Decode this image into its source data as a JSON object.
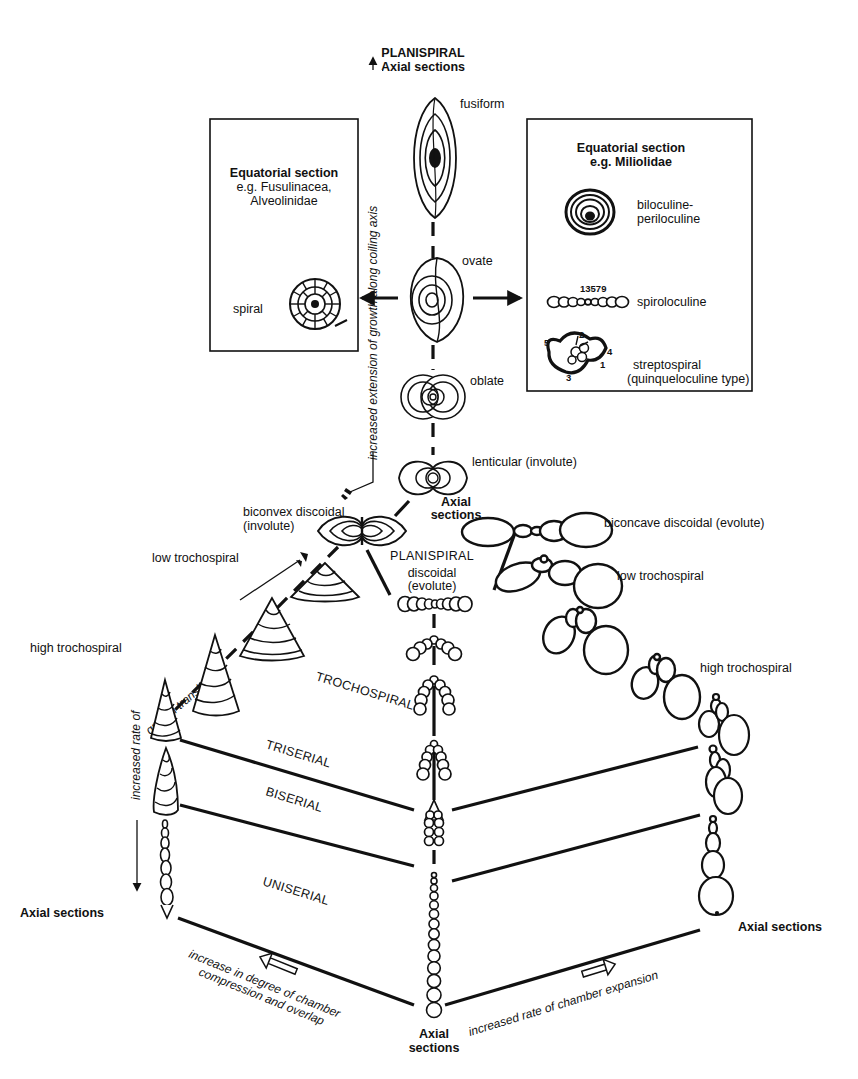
{
  "figure": {
    "colors": {
      "ink": "#111111",
      "background": "#ffffff"
    }
  },
  "top": {
    "planispiral_title": "PLANISPIRAL",
    "axial_sections": "Axial sections",
    "forms": {
      "fusiform": "fusiform",
      "ovate": "ovate",
      "oblate": "oblate",
      "lenticular": "lenticular (involute)"
    },
    "vertical_axis_label": "increased extension of growth along coiling axis"
  },
  "left_box": {
    "title": "Equatorial section",
    "subtitle_line1": "e.g. Fusulinacea,",
    "subtitle_line2": "Alveolinidae",
    "example_label": "spiral"
  },
  "right_box": {
    "title": "Equatorial section",
    "subtitle": "e.g. Miliolidae",
    "items": [
      {
        "label_line1": "biloculine-",
        "label_line2": "periloculine"
      },
      {
        "label_line1": "spiroloculine",
        "numbers": "13579"
      },
      {
        "label_line1": "streptospiral",
        "label_line2": "(quinqueloculine type)",
        "numbers": [
          "1",
          "2",
          "3",
          "4",
          "5"
        ]
      }
    ]
  },
  "center": {
    "axial_sections_line1": "Axial",
    "axial_sections_line2": "sections",
    "planispiral": "PLANISPIRAL",
    "discoidal_line1": "discoidal",
    "discoidal_line2": "(evolute)"
  },
  "left_branch": {
    "biconvex_line1": "biconvex discoidal",
    "biconvex_line2": "(involute)",
    "low_trochospiral": "low trochospiral",
    "high_trochospiral": "high trochospiral",
    "axis_label_diagonal": "growth translation",
    "axis_label_vertical": "increased rate of",
    "axial_sections": "Axial sections"
  },
  "right_branch": {
    "biconcave": "biconcave discoidal (evolute)",
    "low_trochospiral": "low trochospiral",
    "high_trochospiral": "high trochospiral",
    "axial_sections": "Axial sections"
  },
  "bands": {
    "trochospiral": "TROCHOSPIRAL",
    "triserial": "TRISERIAL",
    "biserial": "BISERIAL",
    "uniserial": "UNISERIAL"
  },
  "bottom": {
    "left_arrow_line1": "increase in degree of chamber",
    "left_arrow_line2": "compression and overlap",
    "right_arrow": "increased rate of chamber expansion",
    "axial_line1": "Axial",
    "axial_line2": "sections"
  }
}
